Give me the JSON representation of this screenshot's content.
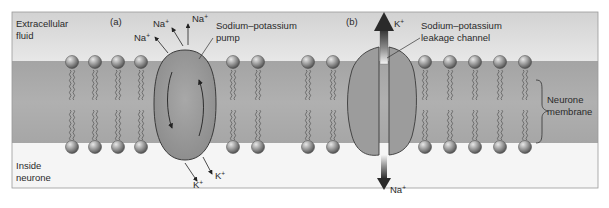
{
  "regions": {
    "extracellular": "Extracellular fluid",
    "extracellular_line1": "Extracellular",
    "extracellular_line2": "fluid",
    "inside": "Inside neurone",
    "inside_line1": "Inside",
    "inside_line2": "neurone",
    "membrane_line1": "Neurone",
    "membrane_line2": "membrane"
  },
  "panel_a": {
    "tag": "(a)",
    "title_line1": "Sodium–potassium",
    "title_line2": "pump",
    "ions_out": [
      {
        "ion": "Na",
        "charge": "+"
      },
      {
        "ion": "Na",
        "charge": "+"
      },
      {
        "ion": "Na",
        "charge": "+"
      }
    ],
    "ions_in": [
      {
        "ion": "K",
        "charge": "+"
      },
      {
        "ion": "K",
        "charge": "+"
      }
    ]
  },
  "panel_b": {
    "tag": "(b)",
    "title_line1": "Sodium–potassium",
    "title_line2": "leakage channel",
    "ion_out": {
      "ion": "K",
      "charge": "+"
    },
    "ion_in": {
      "ion": "Na",
      "charge": "+"
    }
  },
  "lipid_x": [
    72,
    95,
    118,
    141,
    233,
    258,
    308,
    333,
    425,
    450,
    475,
    500,
    525
  ],
  "colors": {
    "extracellular_top": "#d6d6d6",
    "extracellular_bottom": "#e6e6e6",
    "membrane": "#a9a9a9",
    "inside": "#f4f4f4",
    "protein": "#9a9a9a",
    "protein_stroke": "#3a3a3a",
    "head_light": "#d0d0d0",
    "head_dark": "#5a5a5a",
    "arrow": "#222222"
  }
}
